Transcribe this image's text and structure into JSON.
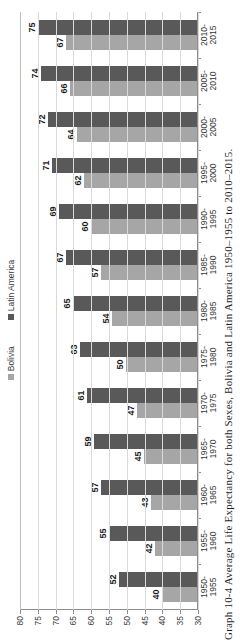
{
  "figure": {
    "caption": "Graph 10-4 Average Life Expectancy for both Sexes, Bolivia and Latin America 1950–1955 to 2010–2015.",
    "legend": [
      {
        "label": "Bolivia",
        "color": "#a6a6a6",
        "swatch_name": "bolivia-swatch"
      },
      {
        "label": "Latin America",
        "color": "#595959",
        "swatch_name": "latin-america-swatch"
      }
    ]
  },
  "chart_data": {
    "type": "bar",
    "title": "",
    "xlabel": "",
    "ylabel": "",
    "ylim": [
      30,
      80
    ],
    "yticks": [
      80,
      75,
      70,
      65,
      60,
      55,
      50,
      45,
      40,
      35,
      30
    ],
    "grid": true,
    "legend_position": "top",
    "orientation": "vertical-rotated-90ccw",
    "categories": [
      "1950-1955",
      "1955-1960",
      "1960-1965",
      "1965-1970",
      "1970-1975",
      "1975-1980",
      "1980-1985",
      "1985-1990",
      "1990-1995",
      "1995-2000",
      "2000-2005",
      "2005-2010",
      "2010-2015"
    ],
    "category_lines": [
      [
        "1950-",
        "1955"
      ],
      [
        "1955-",
        "1960"
      ],
      [
        "1960-",
        "1965"
      ],
      [
        "1965-",
        "1970"
      ],
      [
        "1970-",
        "1975"
      ],
      [
        "1975-",
        "1980"
      ],
      [
        "1980-",
        "1985"
      ],
      [
        "1985-",
        "1990"
      ],
      [
        "1990-",
        "1995"
      ],
      [
        "1995-",
        "2000"
      ],
      [
        "2000-",
        "2005"
      ],
      [
        "2005-",
        "2010"
      ],
      [
        "2010-",
        "2015"
      ]
    ],
    "series": [
      {
        "name": "Bolivia",
        "color": "#a6a6a6",
        "values": [
          40,
          42,
          43,
          45,
          47,
          50,
          54,
          57,
          60,
          62,
          64,
          66,
          67
        ]
      },
      {
        "name": "Latin America",
        "color": "#595959",
        "values": [
          52,
          55,
          57,
          59,
          61,
          63,
          65,
          67,
          69,
          71,
          72,
          74,
          75
        ]
      }
    ]
  }
}
